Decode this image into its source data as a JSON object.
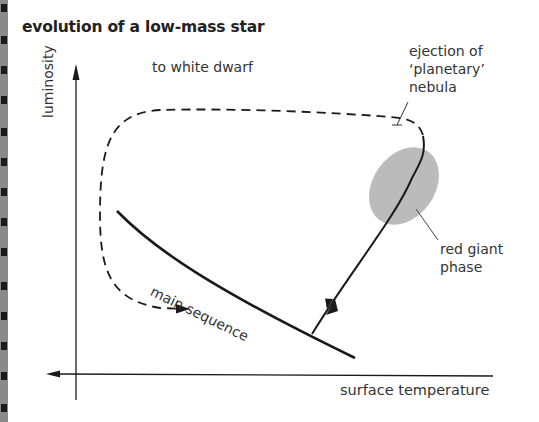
{
  "title": "evolution of a low-mass star",
  "axes": {
    "y_label": "luminosity",
    "x_label": "surface temperature"
  },
  "labels": {
    "white_dwarf": "to white dwarf",
    "nebula_line1": "ejection of",
    "nebula_line2": "‘planetary’",
    "nebula_line3": "nebula",
    "red_giant_line1": "red giant",
    "red_giant_line2": "phase",
    "main_sequence": "main sequence"
  },
  "colors": {
    "line": "#1a1a1a",
    "red_giant_blob": "#b4b4b4",
    "text": "#333333"
  }
}
